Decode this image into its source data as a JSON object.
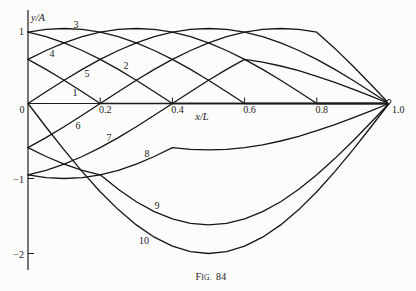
{
  "figure": {
    "caption_prefix": "F",
    "caption_smallcaps": "IG.",
    "caption_number": "84"
  },
  "chart_data": {
    "type": "line",
    "title": "",
    "caption": "Fig. 84",
    "xlabel": "x/L",
    "ylabel": "y/A",
    "xlim": [
      0,
      1.0
    ],
    "ylim": [
      -2.2,
      1.3
    ],
    "grid": false,
    "legend": "inline curve numbers",
    "xticks": [
      {
        "value": 0,
        "label": "0"
      },
      {
        "value": 0.2,
        "label": "0.2"
      },
      {
        "value": 0.4,
        "label": "0.4"
      },
      {
        "value": 0.6,
        "label": "0.6"
      },
      {
        "value": 0.8,
        "label": "0.8"
      },
      {
        "value": 1.0,
        "label": "1.0"
      }
    ],
    "yticks": [
      {
        "value": 1,
        "label": "1"
      },
      {
        "value": -1,
        "label": "−1"
      },
      {
        "value": -2,
        "label": "−2"
      }
    ],
    "x": [
      0,
      0.05,
      0.1,
      0.15,
      0.2,
      0.25,
      0.3,
      0.35,
      0.4,
      0.45,
      0.5,
      0.55,
      0.6,
      0.65,
      0.7,
      0.75,
      0.8,
      0.85,
      0.9,
      0.95,
      1.0
    ],
    "series": [
      {
        "name": "1",
        "values": [
          0.588,
          0.454,
          0.309,
          0.156,
          0,
          0,
          0,
          0,
          0,
          0,
          0,
          0,
          0,
          0,
          0,
          0,
          0,
          0,
          0,
          0,
          0
        ]
      },
      {
        "name": "2",
        "values": [
          0.951,
          0.891,
          0.809,
          0.707,
          0.588,
          0.454,
          0.309,
          0.156,
          0,
          0,
          0,
          0,
          0,
          0,
          0,
          0,
          0,
          0,
          0,
          0,
          0
        ]
      },
      {
        "name": "3",
        "values": [
          0.951,
          0.988,
          1,
          0.988,
          0.951,
          0.891,
          0.809,
          0.707,
          0.588,
          0.454,
          0.309,
          0.156,
          0,
          0,
          0,
          0,
          0,
          0,
          0,
          0,
          0
        ]
      },
      {
        "name": "4",
        "values": [
          0.588,
          0.707,
          0.809,
          0.891,
          0.951,
          0.988,
          1,
          0.988,
          0.951,
          0.891,
          0.809,
          0.707,
          0.588,
          0.454,
          0.309,
          0.156,
          0,
          0,
          0,
          0,
          0
        ]
      },
      {
        "name": "5",
        "values": [
          0,
          0.156,
          0.309,
          0.454,
          0.588,
          0.707,
          0.809,
          0.891,
          0.951,
          0.988,
          1,
          0.988,
          0.951,
          0.891,
          0.809,
          0.707,
          0.588,
          0.454,
          0.309,
          0.156,
          0
        ]
      },
      {
        "name": "6",
        "values": [
          -0.588,
          -0.454,
          -0.309,
          -0.156,
          0,
          0.156,
          0.309,
          0.454,
          0.588,
          0.707,
          0.809,
          0.891,
          0.951,
          0.988,
          1,
          0.988,
          0.951,
          0.735,
          0.5,
          0.253,
          0
        ]
      },
      {
        "name": "7",
        "values": [
          -0.951,
          -0.891,
          -0.809,
          -0.707,
          -0.588,
          -0.454,
          -0.309,
          -0.156,
          0,
          0.156,
          0.309,
          0.454,
          0.588,
          0.551,
          0.5,
          0.437,
          0.363,
          0.281,
          0.191,
          0.097,
          0
        ]
      },
      {
        "name": "8",
        "values": [
          -0.951,
          -0.988,
          -1,
          -0.988,
          -0.951,
          -0.891,
          -0.809,
          -0.707,
          -0.588,
          -0.61,
          -0.618,
          -0.61,
          -0.588,
          -0.551,
          -0.5,
          -0.437,
          -0.363,
          -0.281,
          -0.191,
          -0.097,
          0
        ]
      },
      {
        "name": "9",
        "values": [
          -0.588,
          -0.707,
          -0.809,
          -0.891,
          -0.951,
          -1.144,
          -1.309,
          -1.442,
          -1.539,
          -1.598,
          -1.618,
          -1.598,
          -1.539,
          -1.442,
          -1.309,
          -1.144,
          -0.951,
          -0.735,
          -0.5,
          -0.253,
          0
        ]
      },
      {
        "name": "10",
        "values": [
          0,
          -0.313,
          -0.618,
          -0.908,
          -1.176,
          -1.414,
          -1.618,
          -1.782,
          -1.902,
          -1.975,
          -2,
          -1.975,
          -1.902,
          -1.782,
          -1.618,
          -1.414,
          -1.176,
          -0.908,
          -0.618,
          -0.313,
          0
        ]
      }
    ],
    "annotations": [
      {
        "text": "fixed end (small circle)",
        "x": 1.0,
        "y": 0
      }
    ]
  }
}
